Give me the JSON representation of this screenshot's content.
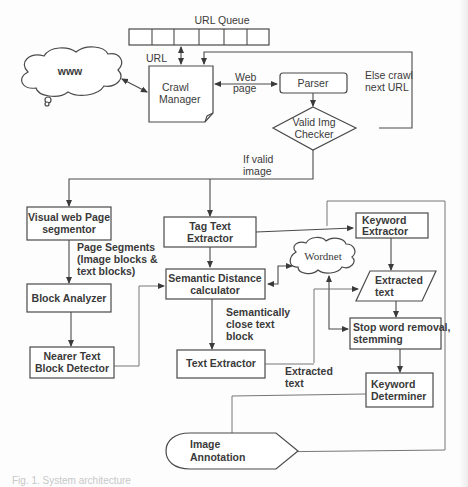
{
  "diagram": {
    "nodes": {
      "url_queue": {
        "label": "URL Queue",
        "cells": 8
      },
      "www": {
        "label": "www"
      },
      "crawl_manager": {
        "line1": "Crawl",
        "line2": "Manager"
      },
      "parser": {
        "label": "Parser"
      },
      "valid_img_checker": {
        "line1": "Valid Img",
        "line2": "Checker"
      },
      "visual_segmentor": {
        "line1": "Visual web Page",
        "line2": "segmentor"
      },
      "tag_text_extractor": {
        "line1": "Tag Text",
        "line2": "Extractor"
      },
      "keyword_extractor": {
        "line1": "Keyword",
        "line2": "Extractor"
      },
      "wordnet": {
        "label": "Wordnet"
      },
      "semantic_distance": {
        "line1": "Semantic Distance",
        "line2": "calculator"
      },
      "extracted_text_io": {
        "line1": "Extracted",
        "line2": "text"
      },
      "block_analyzer": {
        "label": "Block Analyzer"
      },
      "stop_word_removal": {
        "line1": "Stop word removal,",
        "line2": "stemming"
      },
      "nearer_text_detector": {
        "line1": "Nearer Text",
        "line2": "Block Detector"
      },
      "text_extractor": {
        "label": "Text Extractor"
      },
      "keyword_determiner": {
        "line1": "Keyword",
        "line2": "Determiner"
      },
      "image_annotation": {
        "line1": "Image",
        "line2": "Annotation"
      }
    },
    "edge_labels": {
      "url": "URL",
      "web_page": {
        "line1": "Web",
        "line2": "page"
      },
      "else_crawl": {
        "line1": "Else crawl",
        "line2": "next URL"
      },
      "if_valid": {
        "line1": "If valid",
        "line2": "image"
      },
      "page_segments": {
        "line1": "Page Segments",
        "line2": "(Image blocks &",
        "line3": "text blocks)"
      },
      "semantically_close": {
        "line1": "Semantically",
        "line2": "close text",
        "line3": "block"
      },
      "extracted_text": {
        "line1": "Extracted",
        "line2": "text"
      }
    },
    "caption": "Fig. 1. System architecture"
  },
  "colors": {
    "stroke": "#4a4a4a",
    "text": "#3a3a3a",
    "background": "#fdfdfd"
  }
}
